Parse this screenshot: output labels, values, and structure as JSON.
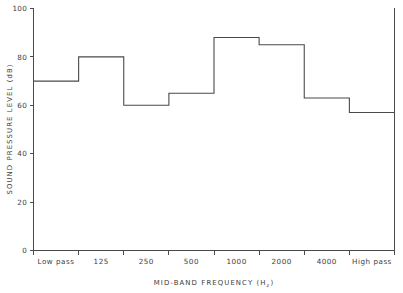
{
  "chart_data": {
    "type": "bar",
    "render_style": "step-histogram",
    "title": "",
    "subtitle": "",
    "xlabel": "MID-BAND FREQUENCY (Hz)",
    "xlabel_main": "MID-BAND FREQUENCY (H",
    "xlabel_sub": "z",
    "xlabel_close": ")",
    "ylabel": "SOUND PRESSURE LEVEL (dB)",
    "categories": [
      "Low pass",
      "125",
      "250",
      "500",
      "1000",
      "2000",
      "4000",
      "High pass"
    ],
    "values": [
      70,
      80,
      60,
      65,
      88,
      85,
      63,
      57
    ],
    "series": [
      {
        "name": "Sound pressure level",
        "values": [
          70,
          80,
          60,
          65,
          88,
          85,
          63,
          57
        ]
      }
    ],
    "ylim": [
      0,
      100
    ],
    "ytick_labels": [
      "0",
      "20",
      "40",
      "60",
      "80",
      "100"
    ],
    "ytick_values": [
      0,
      20,
      40,
      60,
      80,
      100
    ],
    "xtick_labels": [
      "Low pass",
      "125",
      "250",
      "500",
      "1000",
      "2000",
      "4000",
      "High pass"
    ],
    "grid": false,
    "legend": "none",
    "line_color": "#4a4a4a",
    "background_color": "#ffffff"
  },
  "axes": {
    "y_unit": "dB",
    "x_unit": "Hz"
  }
}
